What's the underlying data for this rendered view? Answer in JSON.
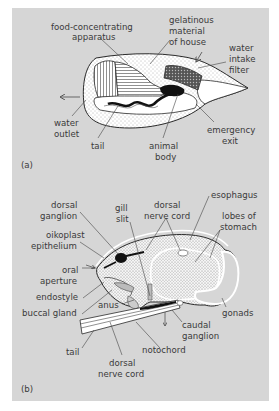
{
  "colors": {
    "panel_background": "#d6d6d6",
    "page_background": "#ffffff",
    "label_text": "#3a3a3a",
    "outline": "#2a2a2a",
    "body_fill": "#ffffff"
  },
  "figure_a": {
    "panel_label": "(a)",
    "labels": {
      "food_concentrating_1": "food-concentrating",
      "food_concentrating_2": "apparatus",
      "gelatinous_1": "gelatinous",
      "gelatinous_2": "material",
      "gelatinous_3": "of house",
      "water_intake_1": "water",
      "water_intake_2": "intake",
      "water_intake_3": "filter",
      "water_outlet_1": "water",
      "water_outlet_2": "outlet",
      "tail": "tail",
      "animal_body_1": "animal",
      "animal_body_2": "body",
      "emergency_exit_1": "emergency",
      "emergency_exit_2": "exit"
    }
  },
  "figure_b": {
    "panel_label": "(b)",
    "labels": {
      "esophagus": "esophagus",
      "dorsal_ganglion_1": "dorsal",
      "dorsal_ganglion_2": "ganglion",
      "gill_slit_1": "gill",
      "gill_slit_2": "slit",
      "dorsal_nerve_cord_top_1": "dorsal",
      "dorsal_nerve_cord_top_2": "nerve cord",
      "lobes_of_stomach_1": "lobes of",
      "lobes_of_stomach_2": "stomach",
      "oikoplast_1": "oikoplast",
      "oikoplast_2": "epithelium",
      "oral_aperture_1": "oral",
      "oral_aperture_2": "aperture",
      "endostyle": "endostyle",
      "anus": "anus",
      "buccal_gland": "buccal gland",
      "gonads": "gonads",
      "caudal_ganglion_1": "caudal",
      "caudal_ganglion_2": "ganglion",
      "tail": "tail",
      "notochord": "notochord",
      "dorsal_nerve_cord_bottom_1": "dorsal",
      "dorsal_nerve_cord_bottom_2": "nerve cord"
    }
  }
}
